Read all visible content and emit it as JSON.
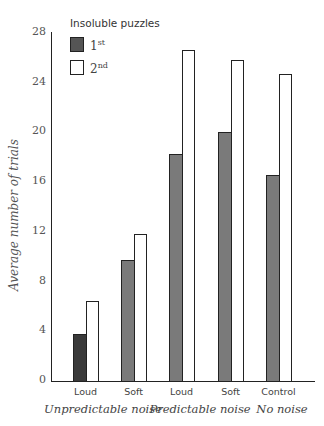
{
  "page": {
    "header_fragment": "... Psychology ..."
  },
  "chart_data": {
    "type": "bar",
    "title": "",
    "xlabel": "",
    "ylabel": "Average number of trials",
    "ylim": [
      0,
      28
    ],
    "yticks": [
      0,
      4,
      8,
      12,
      16,
      20,
      24,
      28
    ],
    "grid": false,
    "legend_title": "Insoluble puzzles",
    "legend_position": "top-left",
    "categories": [
      "Loud",
      "Soft",
      "Loud",
      "Soft",
      "Control"
    ],
    "groups": [
      {
        "label": "Unpredictable noise",
        "categories": [
          "Loud",
          "Soft"
        ]
      },
      {
        "label": "Predictable noise",
        "categories": [
          "Loud",
          "Soft"
        ]
      },
      {
        "label": "No noise",
        "categories": [
          "Control"
        ]
      }
    ],
    "series": [
      {
        "name": "1st",
        "name_base": "1",
        "name_sup": "st",
        "color": "#7a7a7a",
        "values": [
          3.8,
          9.7,
          18.3,
          20.0,
          16.6
        ]
      },
      {
        "name": "2nd",
        "name_base": "2",
        "name_sup": "nd",
        "color": "#ffffff",
        "values": [
          6.4,
          11.8,
          26.6,
          25.8,
          24.7
        ]
      }
    ]
  }
}
